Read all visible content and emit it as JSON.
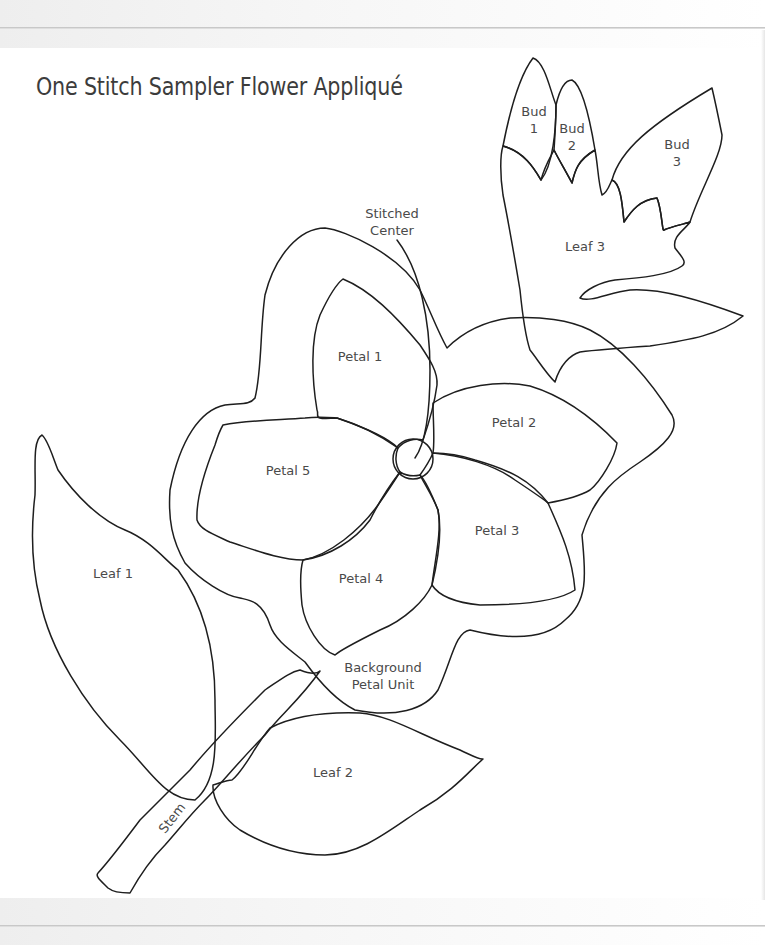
{
  "page": {
    "title": "One Stitch Sampler Flower Appliqué"
  },
  "diagram": {
    "stroke_color": "#1e1e1e",
    "label_color": "#4a4a4a",
    "pieces": [
      {
        "id": "bud-1",
        "label": "Bud\n1",
        "x": 534,
        "y": 120
      },
      {
        "id": "bud-2",
        "label": "Bud\n2",
        "x": 572,
        "y": 137
      },
      {
        "id": "bud-3",
        "label": "Bud\n3",
        "x": 677,
        "y": 153
      },
      {
        "id": "leaf-3",
        "label": "Leaf 3",
        "x": 585,
        "y": 246
      },
      {
        "id": "stitched-center",
        "label": "Stitched\nCenter",
        "x": 392,
        "y": 222
      },
      {
        "id": "petal-1",
        "label": "Petal 1",
        "x": 360,
        "y": 356
      },
      {
        "id": "petal-2",
        "label": "Petal 2",
        "x": 514,
        "y": 422
      },
      {
        "id": "petal-3",
        "label": "Petal 3",
        "x": 497,
        "y": 530
      },
      {
        "id": "petal-4",
        "label": "Petal 4",
        "x": 361,
        "y": 578
      },
      {
        "id": "petal-5",
        "label": "Petal 5",
        "x": 288,
        "y": 470
      },
      {
        "id": "leaf-1",
        "label": "Leaf 1",
        "x": 113,
        "y": 573
      },
      {
        "id": "background-petal-unit",
        "label": "Background\nPetal Unit",
        "x": 383,
        "y": 676
      },
      {
        "id": "leaf-2",
        "label": "Leaf 2",
        "x": 333,
        "y": 772
      },
      {
        "id": "stem",
        "label": "Stem",
        "x": 172,
        "y": 818
      }
    ]
  }
}
